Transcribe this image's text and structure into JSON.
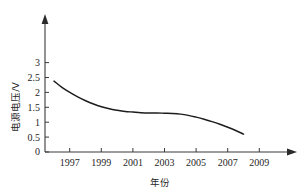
{
  "chart_data": {
    "type": "line",
    "title": "",
    "subtitle": "",
    "xlabel": "年份",
    "ylabel": "电源电压/V",
    "xlim": [
      1995.5,
      2010.5
    ],
    "ylim": [
      0,
      3.3
    ],
    "grid": false,
    "legend": null,
    "x_ticks": [
      "1997",
      "1999",
      "2001",
      "2003",
      "2005",
      "2007",
      "2009"
    ],
    "x_tick_values": [
      1997,
      1999,
      2001,
      2003,
      2005,
      2007,
      2009
    ],
    "y_ticks": [
      "0",
      "0.5",
      "1",
      "1.5",
      "2",
      "2.5",
      "3"
    ],
    "y_tick_values": [
      0,
      0.5,
      1,
      1.5,
      2,
      2.5,
      3
    ],
    "series": [
      {
        "name": "电源电压",
        "x": [
          1996.0,
          1996.5,
          1997.0,
          1997.5,
          1998.0,
          1998.5,
          1999.0,
          1999.5,
          2000.0,
          2000.5,
          2001.0,
          2001.5,
          2002.0,
          2002.5,
          2003.0,
          2003.5,
          2004.0,
          2004.5,
          2005.0,
          2005.5,
          2006.0,
          2006.5,
          2007.0,
          2007.5,
          2008.0
        ],
        "values": [
          2.38,
          2.17,
          2.0,
          1.85,
          1.72,
          1.61,
          1.52,
          1.45,
          1.4,
          1.36,
          1.34,
          1.32,
          1.31,
          1.31,
          1.3,
          1.29,
          1.27,
          1.23,
          1.17,
          1.1,
          1.02,
          0.93,
          0.83,
          0.72,
          0.6
        ]
      }
    ]
  },
  "axes": {
    "x_arrow": "arrow-right-icon",
    "y_arrow": "arrow-up-icon"
  }
}
